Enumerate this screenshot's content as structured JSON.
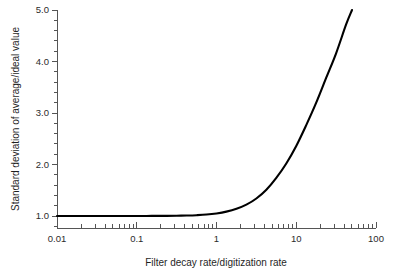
{
  "chart_data": {
    "type": "line",
    "title": "",
    "xlabel": "Filter decay rate/digitization rate",
    "ylabel": "Standard deviation of average/ideal value",
    "xscale": "log",
    "yscale": "linear",
    "xlim": [
      0.01,
      100
    ],
    "ylim": [
      0.6,
      5.0
    ],
    "grid": false,
    "legend": null,
    "xticks": [
      0.01,
      0.1,
      1,
      10,
      100
    ],
    "xtick_labels": [
      "0.01",
      "0.1",
      "1",
      "10",
      "100"
    ],
    "xminor_ticks": [
      0.02,
      0.03,
      0.04,
      0.05,
      0.06,
      0.07,
      0.08,
      0.09,
      0.2,
      0.3,
      0.4,
      0.5,
      0.6,
      0.7,
      0.8,
      0.9,
      2,
      3,
      4,
      5,
      6,
      7,
      8,
      9,
      20,
      30,
      40,
      50,
      60,
      70,
      80,
      90
    ],
    "yticks": [
      1.0,
      2.0,
      3.0,
      4.0,
      5.0
    ],
    "ytick_labels": [
      "1.0",
      "2.0",
      "3.0",
      "4.0",
      "5.0"
    ],
    "yminor_ticks": [
      0.8,
      1.2,
      1.4,
      1.6,
      1.8,
      2.2,
      2.4,
      2.6,
      2.8,
      3.2,
      3.4,
      3.6,
      3.8,
      4.2,
      4.4,
      4.6,
      4.8
    ],
    "series": [
      {
        "name": "standard deviation ratio",
        "color": "#000000",
        "x": [
          0.01,
          0.0133,
          0.0178,
          0.0237,
          0.0316,
          0.0422,
          0.0562,
          0.075,
          0.1,
          0.133,
          0.178,
          0.237,
          0.316,
          0.422,
          0.562,
          0.75,
          1.0,
          1.33,
          1.78,
          2.37,
          3.16,
          4.22,
          5.62,
          7.5,
          10.0,
          13.3,
          17.8,
          23.7,
          31.6,
          42.2,
          50.0
        ],
        "y": [
          1.0,
          1.0,
          1.0,
          1.0,
          1.0,
          1.0,
          1.0,
          1.0,
          1.0,
          1.001,
          1.002,
          1.003,
          1.005,
          1.009,
          1.016,
          1.028,
          1.05,
          1.085,
          1.14,
          1.22,
          1.34,
          1.51,
          1.74,
          2.02,
          2.36,
          2.76,
          3.2,
          3.68,
          4.16,
          4.72,
          5.0
        ]
      }
    ]
  },
  "axes": {
    "x_title": "Filter decay rate/digitization rate",
    "y_title": "Standard deviation of average/ideal value",
    "x_tick_labels": [
      "0.01",
      "0.1",
      "1",
      "10",
      "100"
    ],
    "y_tick_labels": [
      "1.0",
      "2.0",
      "3.0",
      "4.0",
      "5.0"
    ]
  },
  "colors": {
    "curve": "#000000",
    "axis": "#555555",
    "text": "#1f1f1f",
    "background": "#ffffff"
  }
}
